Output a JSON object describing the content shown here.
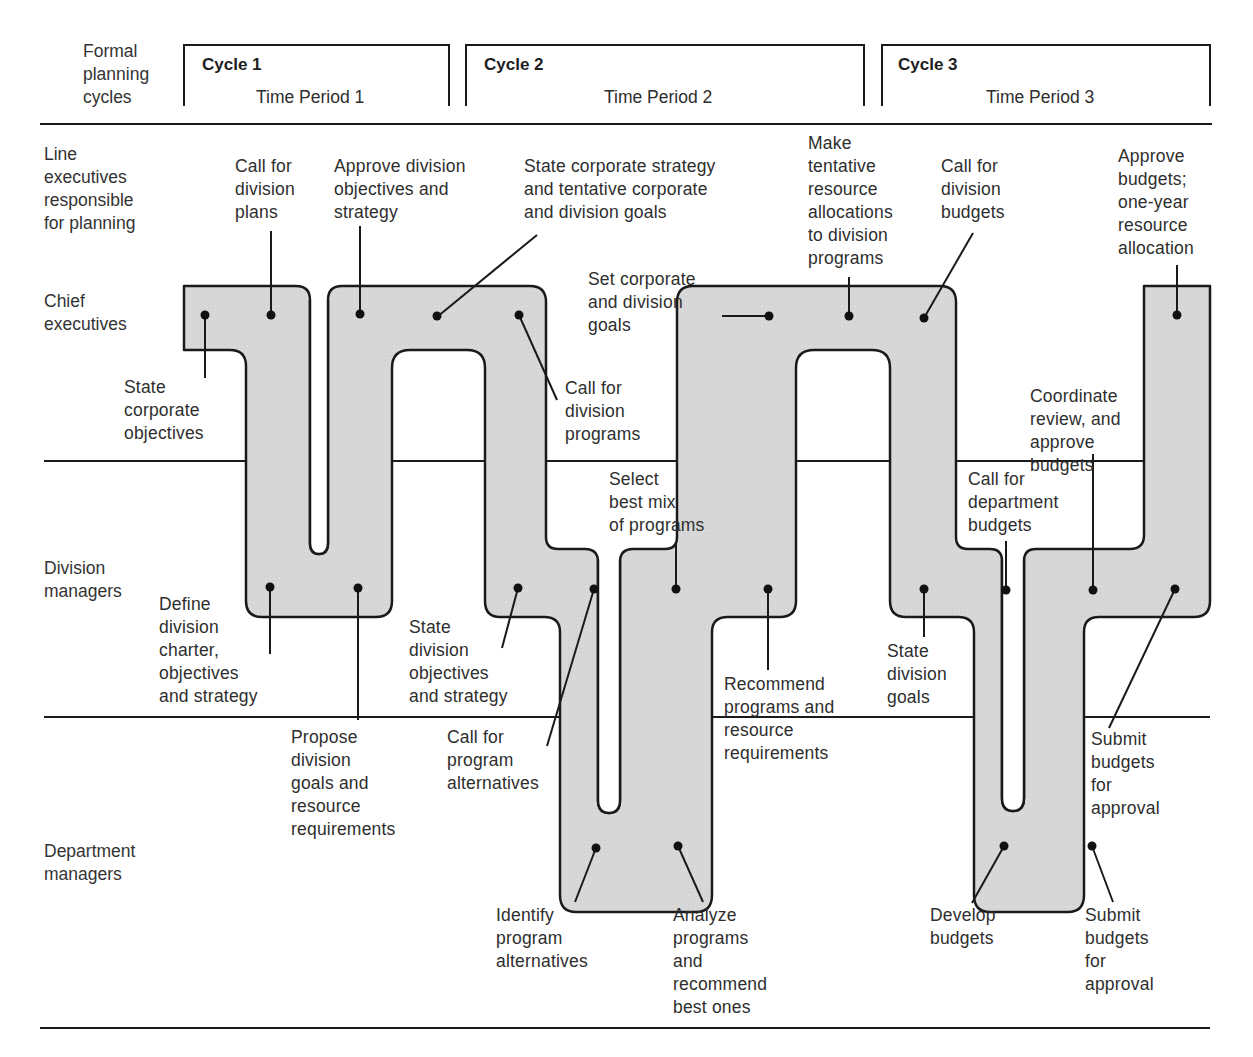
{
  "header": {
    "row_label": "Formal\nplanning\ncycles",
    "cycles": [
      {
        "title": "Cycle 1",
        "period": "Time Period 1"
      },
      {
        "title": "Cycle 2",
        "period": "Time Period 2"
      },
      {
        "title": "Cycle 3",
        "period": "Time Period 3"
      }
    ]
  },
  "lanes": [
    {
      "id": "line-executives",
      "label": "Line\nexecutives\nresponsible\nfor planning"
    },
    {
      "id": "chief-executives",
      "label": "Chief\nexecutives"
    },
    {
      "id": "division-managers",
      "label": "Division\nmanagers"
    },
    {
      "id": "department-managers",
      "label": "Department\nmanagers"
    }
  ],
  "steps": [
    {
      "id": "state-corporate-objectives",
      "text": "State\ncorporate\nobjectives",
      "lane": "chief-executives",
      "cycle": 1
    },
    {
      "id": "call-for-division-plans",
      "text": "Call for\ndivision\nplans",
      "lane": "chief-executives",
      "cycle": 1
    },
    {
      "id": "define-division-charter",
      "text": "Define\ndivision\ncharter,\nobjectives\nand strategy",
      "lane": "division-managers",
      "cycle": 1
    },
    {
      "id": "propose-division-goals",
      "text": "Propose\ndivision\ngoals and\nresource\nrequirements",
      "lane": "division-managers",
      "cycle": 1
    },
    {
      "id": "approve-division-objectives",
      "text": "Approve division\nobjectives and\nstrategy",
      "lane": "chief-executives",
      "cycle": 1
    },
    {
      "id": "state-corporate-strategy",
      "text": "State corporate strategy\nand tentative corporate\nand division goals",
      "lane": "chief-executives",
      "cycle": 2
    },
    {
      "id": "call-for-division-programs",
      "text": "Call for\ndivision\nprograms",
      "lane": "chief-executives",
      "cycle": 2
    },
    {
      "id": "state-division-objectives",
      "text": "State\ndivision\nobjectives\nand strategy",
      "lane": "division-managers",
      "cycle": 2
    },
    {
      "id": "call-for-program-alternatives",
      "text": "Call for\nprogram\nalternatives",
      "lane": "division-managers",
      "cycle": 2
    },
    {
      "id": "identify-program-alternatives",
      "text": "Identify\nprogram\nalternatives",
      "lane": "department-managers",
      "cycle": 2
    },
    {
      "id": "analyze-programs",
      "text": "Analyze\nprograms\nand\nrecommend\nbest ones",
      "lane": "department-managers",
      "cycle": 2
    },
    {
      "id": "select-best-mix",
      "text": "Select\nbest mix\nof programs",
      "lane": "division-managers",
      "cycle": 2
    },
    {
      "id": "recommend-programs",
      "text": "Recommend\nprograms and\nresource\nrequirements",
      "lane": "division-managers",
      "cycle": 2
    },
    {
      "id": "set-corporate-division-goals",
      "text": "Set corporate\nand division\ngoals",
      "lane": "chief-executives",
      "cycle": 2
    },
    {
      "id": "make-tentative-allocations",
      "text": "Make\ntentative\nresource\nallocations\nto division\nprograms",
      "lane": "chief-executives",
      "cycle": 2
    },
    {
      "id": "call-for-division-budgets",
      "text": "Call for\ndivision\nbudgets",
      "lane": "chief-executives",
      "cycle": 3
    },
    {
      "id": "state-division-goals",
      "text": "State\ndivision\ngoals",
      "lane": "division-managers",
      "cycle": 3
    },
    {
      "id": "call-for-department-budgets",
      "text": "Call for\ndepartment\nbudgets",
      "lane": "division-managers",
      "cycle": 3
    },
    {
      "id": "develop-budgets",
      "text": "Develop\nbudgets",
      "lane": "department-managers",
      "cycle": 3
    },
    {
      "id": "submit-budgets-dept",
      "text": "Submit\nbudgets\nfor\napproval",
      "lane": "department-managers",
      "cycle": 3
    },
    {
      "id": "coordinate-review",
      "text": "Coordinate\nreview, and\napprove\nbudgets",
      "lane": "division-managers",
      "cycle": 3
    },
    {
      "id": "submit-budgets-div",
      "text": "Submit\nbudgets\nfor\napproval",
      "lane": "division-managers",
      "cycle": 3
    },
    {
      "id": "approve-budgets",
      "text": "Approve\nbudgets;\none-year\nresource\nallocation",
      "lane": "chief-executives",
      "cycle": 3
    }
  ],
  "colors": {
    "band_fill": "#d6d6d6",
    "band_stroke": "#1a1a1a",
    "line": "#1a1a1a",
    "text": "#2e2e2e"
  }
}
